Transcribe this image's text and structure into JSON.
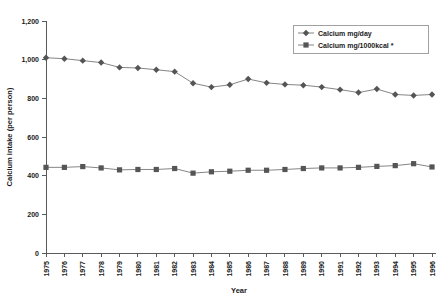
{
  "chart_data": {
    "type": "line",
    "title": "",
    "xlabel": "Year",
    "ylabel": "Calcium intake (per person)",
    "categories": [
      "1975",
      "1976",
      "1977",
      "1978",
      "1979",
      "1980",
      "1981",
      "1982",
      "1983",
      "1984",
      "1985",
      "1986",
      "1987",
      "1988",
      "1989",
      "1990",
      "1991",
      "1992",
      "1993",
      "1994",
      "1995",
      "1996"
    ],
    "xlim": [
      1975,
      1996
    ],
    "ylim": [
      0,
      1200
    ],
    "yticks": [
      0,
      200,
      400,
      600,
      800,
      1000,
      1200
    ],
    "ytick_labels": [
      "0",
      "200",
      "400",
      "600",
      "800",
      "1,000",
      "1,200"
    ],
    "grid": false,
    "legend_position": "top-right",
    "series": [
      {
        "name": "Calcium mg/day",
        "marker": "diamond",
        "color": "#555555",
        "values": [
          1010,
          1005,
          995,
          985,
          960,
          957,
          948,
          938,
          878,
          858,
          870,
          900,
          880,
          872,
          868,
          858,
          845,
          830,
          848,
          820,
          815,
          820
        ]
      },
      {
        "name": "Calcium mg/1000kcal *",
        "marker": "square",
        "color": "#555555",
        "values": [
          443,
          443,
          447,
          440,
          430,
          432,
          432,
          437,
          413,
          420,
          423,
          428,
          428,
          432,
          437,
          440,
          440,
          443,
          448,
          452,
          462,
          445
        ]
      }
    ]
  },
  "legend": {
    "items": [
      {
        "label": "Calcium mg/day"
      },
      {
        "label": "Calcium mg/1000kcal *"
      }
    ]
  },
  "axes": {
    "y_title": "Calcium intake (per person)",
    "x_title": "Year"
  }
}
